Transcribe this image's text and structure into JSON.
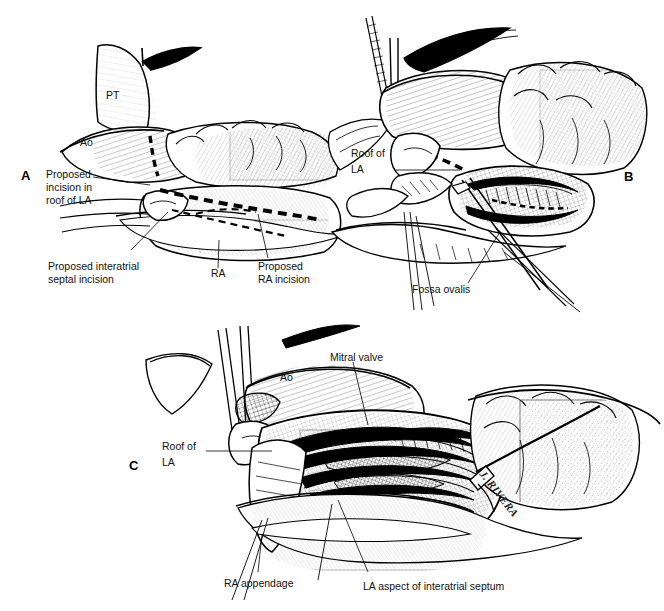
{
  "figure": {
    "kind": "medical-illustration",
    "style": "pen-and-ink line drawing with cross-hatching",
    "background_color": "#ffffff",
    "ink_color": "#000000",
    "panel_count": 3
  },
  "panels": [
    {
      "letter": "A",
      "caption_labels": [
        {
          "id": "pt",
          "text": "PT"
        },
        {
          "id": "ao",
          "text": "Ao"
        },
        {
          "id": "ra",
          "text": "RA"
        },
        {
          "id": "roof_la",
          "text": "Proposed\nincision in\nroof of LA"
        },
        {
          "id": "septal",
          "text": "Proposed interatrial\nseptal incision"
        },
        {
          "id": "ra_inc",
          "text": "Proposed\nRA incision"
        }
      ]
    },
    {
      "letter": "B",
      "caption_labels": [
        {
          "id": "roof_la_b",
          "text": "Roof of\nLA"
        },
        {
          "id": "fossa",
          "text": "Fossa ovalis"
        }
      ]
    },
    {
      "letter": "C",
      "caption_labels": [
        {
          "id": "ao_c",
          "text": "Ao"
        },
        {
          "id": "mitral",
          "text": "Mitral valve"
        },
        {
          "id": "roof_la_c",
          "text": "Roof of\nLA"
        },
        {
          "id": "ra_app",
          "text": "RA appendage"
        },
        {
          "id": "la_septum",
          "text": "LA aspect of interatrial septum"
        }
      ]
    }
  ],
  "labels": {
    "a_letter": "A",
    "b_letter": "B",
    "c_letter": "C",
    "a_pt": "PT",
    "a_ao": "Ao",
    "a_ra": "RA",
    "a_roof_line1": "Proposed",
    "a_roof_line2": "incision in",
    "a_roof_line3": "roof of LA",
    "a_septal_line1": "Proposed interatrial",
    "a_septal_line2": "septal incision",
    "a_rainc_line1": "Proposed",
    "a_rainc_line2": "RA incision",
    "b_roof_line1": "Roof of",
    "b_roof_line2": "LA",
    "b_fossa": "Fossa ovalis",
    "c_ao": "Ao",
    "c_mitral": "Mitral valve",
    "c_roof_line1": "Roof of",
    "c_roof_line2": "LA",
    "c_ra_app": "RA appendage",
    "c_la_septum": "LA aspect of interatrial septum",
    "signature": "J. RIVERA"
  }
}
